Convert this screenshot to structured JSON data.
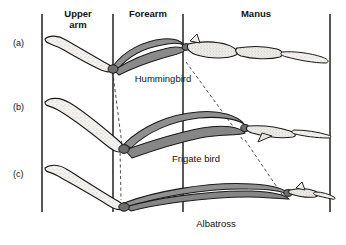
{
  "figure": {
    "background_color": "#ffffff",
    "line_color": "#111111",
    "bone_light_color": "#f2f0eb",
    "bone_shaded_color": "#8a8a8a",
    "bone_outline_color": "#1a1a1a",
    "dashed_color": "#333333"
  },
  "column_headers": [
    {
      "label": "Upper\narm",
      "x": 78,
      "y": 9
    },
    {
      "label": "Forearm",
      "x": 152,
      "y": 9
    },
    {
      "label": "Manus",
      "x": 256,
      "y": 9
    }
  ],
  "dividers": [
    {
      "name": "divider-left-edge",
      "x": 42,
      "y1": 14,
      "y2": 212
    },
    {
      "name": "divider-upperarm-forearm",
      "x": 113,
      "y1": 14,
      "y2": 212
    },
    {
      "name": "divider-forearm-manus",
      "x": 183,
      "y1": 14,
      "y2": 212
    },
    {
      "name": "divider-right-edge",
      "x": 330,
      "y1": 14,
      "y2": 212
    }
  ],
  "rows": [
    {
      "id": "a",
      "label": "(a)",
      "label_x": 14,
      "label_y": 44,
      "species": "Hummingbird",
      "species_x": 163,
      "species_y": 80
    },
    {
      "id": "b",
      "label": "(b)",
      "label_x": 14,
      "label_y": 108,
      "species": "Frigate bird",
      "species_x": 196,
      "species_y": 160
    },
    {
      "id": "c",
      "label": "(c)",
      "label_x": 14,
      "label_y": 175,
      "species": "Albatross",
      "species_x": 216,
      "species_y": 225
    }
  ],
  "bone_regions": [
    "humerus",
    "radius-ulna",
    "carpometacarpus",
    "digits"
  ]
}
